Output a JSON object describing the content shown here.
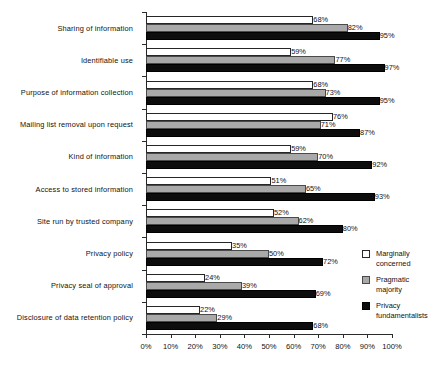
{
  "chart_data": {
    "type": "bar",
    "orientation": "horizontal",
    "title": "",
    "subtitle": "",
    "xlabel": "",
    "ylabel": "",
    "xlim": [
      0,
      100
    ],
    "grid": false,
    "legend_position": "right-bottom",
    "xtick_labels": [
      "0%",
      "10%",
      "20%",
      "30%",
      "40%",
      "50%",
      "60%",
      "70%",
      "80%",
      "90%",
      "100%"
    ],
    "xticks": [
      0,
      10,
      20,
      30,
      40,
      50,
      60,
      70,
      80,
      90,
      100
    ],
    "categories": [
      "Sharing of information",
      "Identifiable use",
      "Purpose of information collection",
      "Mailing list removal upon request",
      "Kind of information",
      "Access to stored information",
      "Site run by trusted company",
      "Privacy policy",
      "Privacy seal of approval",
      "Disclosure of data retention policy"
    ],
    "series": [
      {
        "name": "Marginally concerned",
        "color": "#ffffff",
        "values": [
          68,
          59,
          68,
          76,
          59,
          51,
          52,
          35,
          24,
          22
        ],
        "labels": [
          "68%",
          "59%",
          "68%",
          "76%",
          "59%",
          "51%",
          "52%",
          "35%",
          "24%",
          "22%"
        ]
      },
      {
        "name": "Pragmatic majority",
        "color": "#a9a9a9",
        "values": [
          82,
          77,
          73,
          71,
          70,
          65,
          62,
          50,
          39,
          29
        ],
        "labels": [
          "82%",
          "77%",
          "73%",
          "71%",
          "70%",
          "65%",
          "62%",
          "50%",
          "39%",
          "29%"
        ]
      },
      {
        "name": "Privacy fundamentalists",
        "color": "#0d0d0d",
        "values": [
          95,
          97,
          95,
          87,
          92,
          93,
          80,
          72,
          69,
          68
        ],
        "labels": [
          "95%",
          "97%",
          "95%",
          "87%",
          "92%",
          "93%",
          "80%",
          "72%",
          "69%",
          "68%"
        ]
      }
    ]
  },
  "legend": {
    "items": [
      {
        "label": "Marginally\nconcerned",
        "swatch": "s0"
      },
      {
        "label": "Pragmatic\nmajority",
        "swatch": "s1"
      },
      {
        "label": "Privacy\nfundamentalists",
        "swatch": "s2"
      }
    ]
  }
}
